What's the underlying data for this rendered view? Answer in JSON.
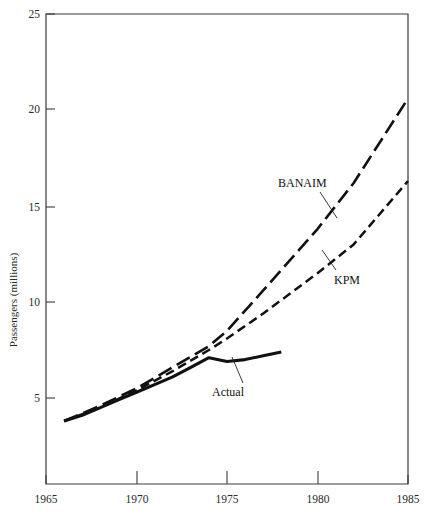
{
  "chart_data": {
    "type": "line",
    "title": "",
    "xlabel": "",
    "ylabel": "Passengers (millions)",
    "xlim": [
      1965,
      1985
    ],
    "ylim": [
      0,
      25
    ],
    "grid": false,
    "legend_position": "inline-annotations",
    "xticks": [
      "1965",
      "1970",
      "1975",
      "1980",
      "1985"
    ],
    "xtick_values": [
      1965,
      1970,
      1975,
      1980,
      1985
    ],
    "yticks": [
      "5",
      "10",
      "15",
      "20",
      "25"
    ],
    "ytick_values": [
      5,
      10,
      15,
      20,
      25
    ],
    "series": [
      {
        "name": "Actual",
        "style": "solid",
        "x": [
          1966,
          1967,
          1968,
          1969,
          1970,
          1971,
          1972,
          1973,
          1974,
          1975,
          1976,
          1977,
          1978
        ],
        "values": [
          3.8,
          4.1,
          4.5,
          4.9,
          5.3,
          5.7,
          6.1,
          6.6,
          7.1,
          6.9,
          7.0,
          7.2,
          7.4
        ]
      },
      {
        "name": "KPM",
        "style": "dashed-short",
        "x": [
          1966,
          1968,
          1970,
          1972,
          1974,
          1975,
          1977,
          1980,
          1982,
          1985
        ],
        "values": [
          3.8,
          4.5,
          5.4,
          6.4,
          7.5,
          8.1,
          9.4,
          11.5,
          13.0,
          16.3
        ]
      },
      {
        "name": "BANAIM",
        "style": "dashed-long",
        "x": [
          1966,
          1968,
          1970,
          1972,
          1974,
          1975,
          1977,
          1980,
          1982,
          1985
        ],
        "values": [
          3.8,
          4.6,
          5.5,
          6.6,
          7.7,
          8.5,
          10.6,
          13.8,
          16.2,
          20.6
        ]
      }
    ],
    "annotations": [
      {
        "text": "BANAIM",
        "x": 1978.6,
        "y": 17.3
      },
      {
        "text": "KPM",
        "x": 1981.6,
        "y": 11.6
      },
      {
        "text": "Actual",
        "x": 1975.7,
        "y": 5.7
      }
    ]
  },
  "axis": {
    "ylabel": "Passengers (millions)"
  },
  "labels": {
    "banaim": "BANAIM",
    "kpm": "KPM",
    "actual": "Actual",
    "y_25": "25",
    "y_20": "20",
    "y_15": "15",
    "y_10": "10",
    "y_5": "5",
    "x_1965": "1965",
    "x_1970": "1970",
    "x_1975": "1975",
    "x_1980": "1980",
    "x_1985": "1985"
  }
}
